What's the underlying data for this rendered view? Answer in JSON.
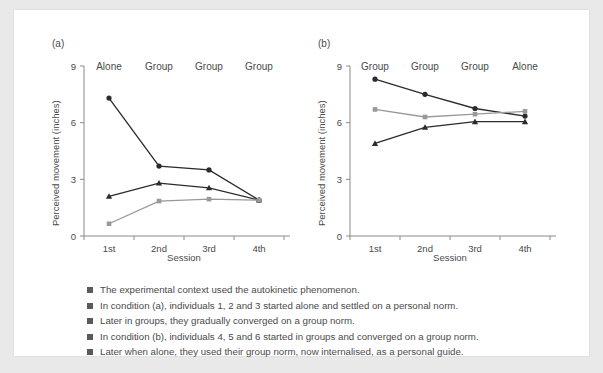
{
  "panels": [
    {
      "id": "a",
      "label": "(a)",
      "condition_labels": [
        "Alone",
        "Group",
        "Group",
        "Group"
      ]
    },
    {
      "id": "b",
      "label": "(b)",
      "condition_labels": [
        "Group",
        "Group",
        "Group",
        "Alone"
      ]
    }
  ],
  "axes": {
    "ylabel": "Perceived movement (inches)",
    "xlabel": "Session",
    "yticks": [
      "0",
      "3",
      "6",
      "9"
    ],
    "xticks": [
      "1st",
      "2nd",
      "3rd",
      "4th"
    ]
  },
  "bullets": [
    "The experimental context used the autokinetic phenomenon.",
    "In condition (a), individuals 1, 2 and 3 started alone and settled on a personal norm.",
    "Later in groups, they gradually converged on a group norm.",
    "In condition (b), individuals 4, 5 and 6 started in groups and converged on a group norm.",
    "Later when alone, they used their group norm, now internalised, as a personal guide."
  ],
  "colors": {
    "dark": "#2b2b2b",
    "mid": "#4a4a4a",
    "light": "#999999",
    "axis": "#8a8a8a",
    "card": "#ffffff",
    "page": "#e9e9e9",
    "bullet": "#5a5a5a"
  },
  "chart_data": [
    {
      "type": "line",
      "title": "(a)",
      "xlabel": "Session",
      "ylabel": "Perceived movement (inches)",
      "categories": [
        "1st",
        "2nd",
        "3rd",
        "4th"
      ],
      "category_conditions": [
        "Alone",
        "Group",
        "Group",
        "Group"
      ],
      "ylim": [
        0,
        9
      ],
      "yticks": [
        0,
        3,
        6,
        9
      ],
      "grid": false,
      "legend": "none",
      "series": [
        {
          "name": "Individual 1",
          "marker": "circle",
          "color": "#2b2b2b",
          "values": [
            7.3,
            3.7,
            3.5,
            1.9
          ]
        },
        {
          "name": "Individual 2",
          "marker": "triangle",
          "color": "#2b2b2b",
          "values": [
            2.1,
            2.8,
            2.55,
            1.9
          ]
        },
        {
          "name": "Individual 3",
          "marker": "square",
          "color": "#999999",
          "values": [
            0.65,
            1.85,
            1.95,
            1.9
          ]
        }
      ]
    },
    {
      "type": "line",
      "title": "(b)",
      "xlabel": "Session",
      "ylabel": "Perceived movement (inches)",
      "categories": [
        "1st",
        "2nd",
        "3rd",
        "4th"
      ],
      "category_conditions": [
        "Group",
        "Group",
        "Group",
        "Alone"
      ],
      "ylim": [
        0,
        9
      ],
      "yticks": [
        0,
        3,
        6,
        9
      ],
      "grid": false,
      "legend": "none",
      "series": [
        {
          "name": "Individual 4",
          "marker": "circle",
          "color": "#2b2b2b",
          "values": [
            8.3,
            7.5,
            6.75,
            6.35
          ]
        },
        {
          "name": "Individual 5",
          "marker": "square",
          "color": "#999999",
          "values": [
            6.7,
            6.3,
            6.45,
            6.6
          ]
        },
        {
          "name": "Individual 6",
          "marker": "triangle",
          "color": "#2b2b2b",
          "values": [
            4.9,
            5.75,
            6.05,
            6.05
          ]
        }
      ]
    }
  ]
}
